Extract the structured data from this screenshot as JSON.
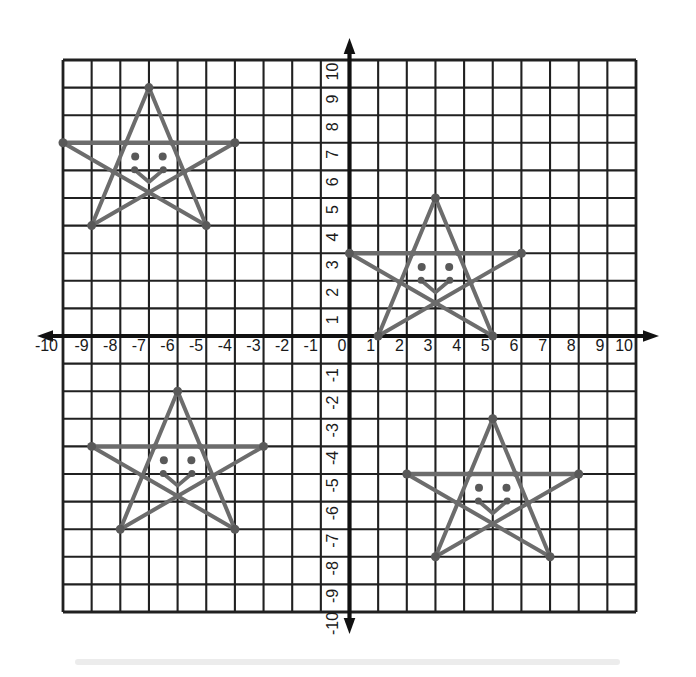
{
  "figure": {
    "kind": "printed coordinate-plane worksheet figure",
    "content": "Four identical five-pointed stars with smiley faces plotted on a 20x20 grid"
  },
  "chart_data": {
    "type": "line",
    "title": "",
    "xlabel": "",
    "ylabel": "",
    "xlim": [
      -10,
      10
    ],
    "ylim": [
      -10,
      10
    ],
    "grid": true,
    "x_tick_labels": [
      "-10",
      "-9",
      "-8",
      "-7",
      "-6",
      "-5",
      "-4",
      "-3",
      "-2",
      "-1",
      "0",
      "1",
      "2",
      "3",
      "4",
      "5",
      "6",
      "7",
      "8",
      "9",
      "10"
    ],
    "y_tick_labels_top_to_bottom": [
      "10",
      "9",
      "8",
      "7",
      "6",
      "5",
      "4",
      "3",
      "2",
      "1",
      "-1",
      "-2",
      "-3",
      "-4",
      "-5",
      "-6",
      "-7",
      "-8",
      "-9",
      "-10"
    ],
    "colors": {
      "grid_line": "#202020",
      "axis": "#111111",
      "star": "#6c6c6c",
      "star_dot": "#595959",
      "tick_text": "#1a1a1a"
    },
    "star_template": {
      "edges": [
        [
          "left_arm",
          "right_arm"
        ],
        [
          "left_arm",
          "bottom_right"
        ],
        [
          "right_arm",
          "bottom_left"
        ],
        [
          "bottom_left",
          "top"
        ],
        [
          "bottom_right",
          "top"
        ]
      ],
      "inner_points": [
        [
          2.2,
          3
        ],
        [
          3.8,
          3
        ],
        [
          3.0,
          1.2
        ],
        [
          1.77,
          1.94
        ],
        [
          4.23,
          1.94
        ]
      ],
      "eyes": [
        [
          2.52,
          2.5
        ],
        [
          3.48,
          2.5
        ]
      ],
      "mouth": [
        [
          2.5,
          2.02
        ],
        [
          3.0,
          1.58
        ],
        [
          3.5,
          2.02
        ]
      ]
    },
    "stars": [
      {
        "name": "quadrant-2-top-left",
        "points": {
          "top": [
            -7,
            9
          ],
          "left_arm": [
            -10,
            7
          ],
          "right_arm": [
            -4,
            7
          ],
          "bottom_left": [
            -9,
            4
          ],
          "bottom_right": [
            -5,
            4
          ]
        }
      },
      {
        "name": "quadrant-1-right",
        "points": {
          "top": [
            3,
            5
          ],
          "left_arm": [
            0,
            3
          ],
          "right_arm": [
            6,
            3
          ],
          "bottom_left": [
            1,
            0
          ],
          "bottom_right": [
            5,
            0
          ]
        }
      },
      {
        "name": "quadrant-3-bottom-left",
        "points": {
          "top": [
            -6,
            -2
          ],
          "left_arm": [
            -9,
            -4
          ],
          "right_arm": [
            -3,
            -4
          ],
          "bottom_left": [
            -8,
            -7
          ],
          "bottom_right": [
            -4,
            -7
          ]
        }
      },
      {
        "name": "quadrant-4-bottom-right",
        "points": {
          "top": [
            5,
            -3
          ],
          "left_arm": [
            2,
            -5
          ],
          "right_arm": [
            8,
            -5
          ],
          "bottom_left": [
            3,
            -8
          ],
          "bottom_right": [
            7,
            -8
          ]
        }
      }
    ]
  }
}
